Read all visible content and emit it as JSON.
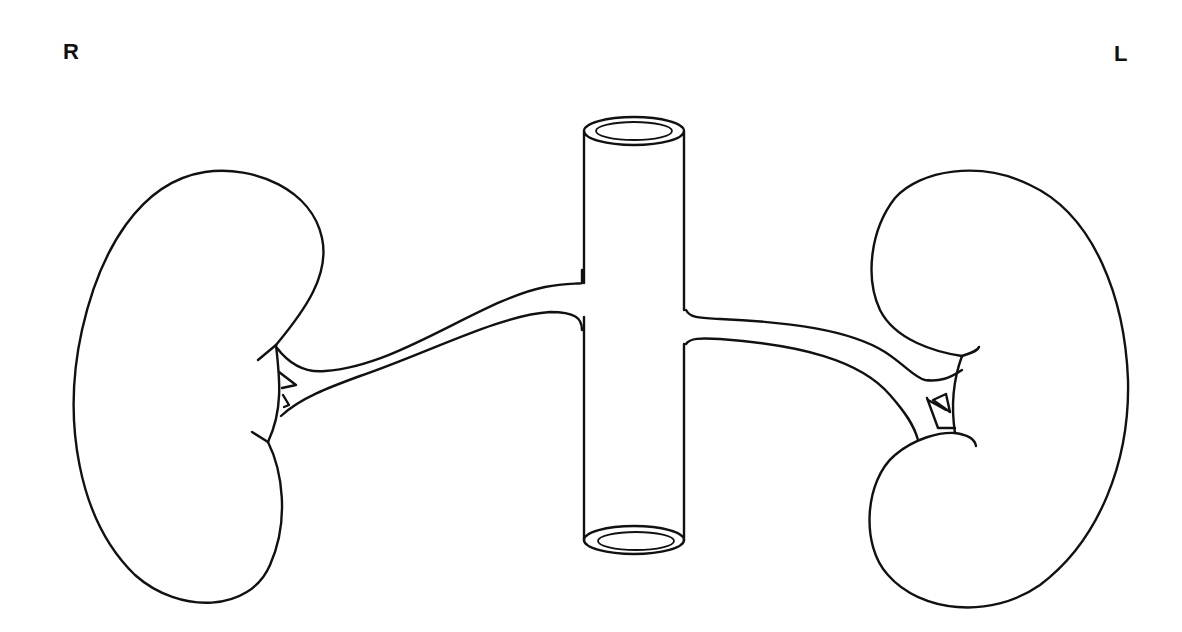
{
  "diagram": {
    "type": "anatomical line drawing",
    "orientation_labels": {
      "right": "R",
      "left": "L"
    },
    "parts": [
      {
        "name": "right-kidney",
        "position": "left of image"
      },
      {
        "name": "left-kidney",
        "position": "right of image"
      },
      {
        "name": "inferior-vena-cava",
        "position": "center, vertical cylinder"
      },
      {
        "name": "right-renal-vein",
        "position": "connecting right kidney hilum to vena cava"
      },
      {
        "name": "left-renal-vein",
        "position": "connecting left kidney hilum to vena cava"
      }
    ],
    "colors": {
      "line": "#111111",
      "background": "#ffffff"
    }
  }
}
